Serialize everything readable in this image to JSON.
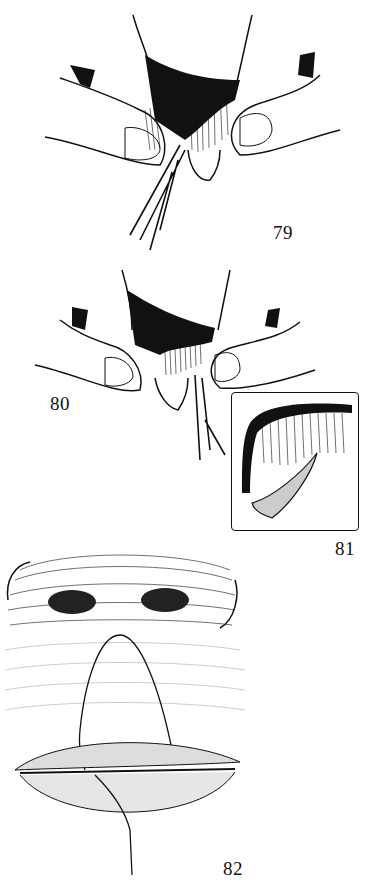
{
  "figures": [
    {
      "number": "79",
      "description": "Surgical illustration: fingers holding everted lip with scissors incising at center"
    },
    {
      "number": "80",
      "description": "Surgical illustration: fingers holding lip with scissors trimming edge"
    },
    {
      "number": "81",
      "description": "Inset: close-up of lip edge incision"
    },
    {
      "number": "82",
      "description": "Illustration: nose and lips with sutured flap from columella through upper and lower lip"
    }
  ],
  "colors": {
    "ink": "#111111",
    "background": "#ffffff"
  }
}
